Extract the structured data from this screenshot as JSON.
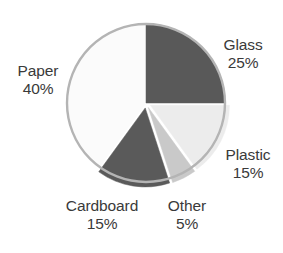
{
  "chart_data": {
    "type": "pie",
    "title": "",
    "subtitle": "",
    "xlabel": "",
    "ylabel": "",
    "grid": false,
    "legend_position": "none",
    "label_format": "name_above_percent",
    "start_angle_deg": 0,
    "direction": "clockwise",
    "categories": [
      "Glass",
      "Plastic",
      "Other",
      "Cardboard",
      "Paper"
    ],
    "values": [
      25,
      15,
      5,
      15,
      40
    ],
    "units": "%",
    "slices": [
      {
        "name": "Glass",
        "value": 25,
        "value_text": "25%",
        "color": "#595959",
        "start_pct": 0,
        "end_pct": 25,
        "exploded": false,
        "label_position": "outside-right-top"
      },
      {
        "name": "Plastic",
        "value": 15,
        "value_text": "15%",
        "color": "#ececec",
        "start_pct": 25,
        "end_pct": 40,
        "exploded": true,
        "label_position": "outside-right-bottom"
      },
      {
        "name": "Other",
        "value": 5,
        "value_text": "5%",
        "color": "#c9c9c9",
        "start_pct": 40,
        "end_pct": 45,
        "exploded": true,
        "label_position": "outside-bottom-right"
      },
      {
        "name": "Cardboard",
        "value": 15,
        "value_text": "15%",
        "color": "#5a5a5a",
        "start_pct": 45,
        "end_pct": 60,
        "exploded": true,
        "label_position": "outside-bottom-left"
      },
      {
        "name": "Paper",
        "value": 40,
        "value_text": "40%",
        "color": "#fbfbfb",
        "start_pct": 60,
        "end_pct": 100,
        "exploded": false,
        "label_position": "outside-left"
      }
    ],
    "plot_area": {
      "center_x": 146,
      "center_y": 103,
      "radius": 79,
      "outline_color": "#b4b4b4",
      "outline_width": 2.4,
      "background": "#ffffff"
    },
    "text_color": "#3a3a3a"
  },
  "labels": {
    "glass": {
      "name": "Glass",
      "value": "25%"
    },
    "paper": {
      "name": "Paper",
      "value": "40%"
    },
    "plastic": {
      "name": "Plastic",
      "value": "15%"
    },
    "cardboard": {
      "name": "Cardboard",
      "value": "15%"
    },
    "other": {
      "name": "Other",
      "value": "5%"
    }
  }
}
